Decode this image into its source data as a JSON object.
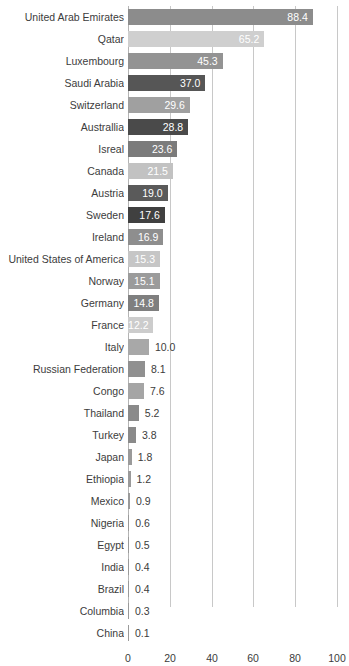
{
  "chart_data": {
    "type": "bar",
    "orientation": "horizontal",
    "title": "",
    "subtitle": "",
    "xlabel": "",
    "ylabel": "",
    "xlim": [
      0,
      100
    ],
    "x_ticks": [
      "0",
      "20",
      "40",
      "60",
      "80",
      "100"
    ],
    "x_tick_values": [
      0,
      20,
      40,
      60,
      80,
      100
    ],
    "grid": true,
    "legend": "none",
    "value_label_format": "one-decimal",
    "categories": [
      "United Arab Emirates",
      "Qatar",
      "Luxembourg",
      "Saudi Arabia",
      "Switzerland",
      "Australlia",
      "Isreal",
      "Canada",
      "Austria",
      "Sweden",
      "Ireland",
      "United States of America",
      "Norway",
      "Germany",
      "France",
      "Italy",
      "Russian Federation",
      "Congo",
      "Thailand",
      "Turkey",
      "Japan",
      "Ethiopia",
      "Mexico",
      "Nigeria",
      "Egypt",
      "India",
      "Brazil",
      "Columbia",
      "China"
    ],
    "values": [
      88.4,
      65.2,
      45.3,
      37.0,
      29.6,
      28.8,
      23.6,
      21.5,
      19.0,
      17.6,
      16.9,
      15.3,
      15.1,
      14.8,
      12.2,
      10.0,
      8.1,
      7.6,
      5.2,
      3.8,
      1.8,
      1.2,
      0.9,
      0.6,
      0.5,
      0.4,
      0.4,
      0.3,
      0.1
    ],
    "value_labels": [
      "88.4",
      "65.2",
      "45.3",
      "37.0",
      "29.6",
      "28.8",
      "23.6",
      "21.5",
      "19.0",
      "17.6",
      "16.9",
      "15.3",
      "15.1",
      "14.8",
      "12.2",
      "10.0",
      "8.1",
      "7.6",
      "5.2",
      "3.8",
      "1.8",
      "1.2",
      "0.9",
      "0.6",
      "0.5",
      "0.4",
      "0.4",
      "0.3",
      "0.1"
    ],
    "bar_colors": [
      "#8c8c8c",
      "#cfcfcf",
      "#939393",
      "#565656",
      "#a0a0a0",
      "#4a4a4a",
      "#7b7b7b",
      "#c2c2c2",
      "#5a5a5a",
      "#404040",
      "#8e8e8e",
      "#c6c6c6",
      "#9b9b9b",
      "#7f7f7f",
      "#cccccc",
      "#a8a8a8",
      "#909090",
      "#a5a5a5",
      "#8a8a8a",
      "#8a8a8a",
      "#9a9a9a",
      "#9a9a9a",
      "#9a9a9a",
      "#9a9a9a",
      "#9a9a9a",
      "#9a9a9a",
      "#9a9a9a",
      "#9a9a9a",
      "#9a9a9a"
    ],
    "label_placement": [
      "inside",
      "inside",
      "inside",
      "inside",
      "inside",
      "inside",
      "inside",
      "inside",
      "inside",
      "inside",
      "inside",
      "inside",
      "inside",
      "inside",
      "inside",
      "outside",
      "outside",
      "outside",
      "outside",
      "outside",
      "outside",
      "outside",
      "outside",
      "outside",
      "outside",
      "outside",
      "outside",
      "outside",
      "outside"
    ]
  },
  "style": {
    "background": "#ffffff",
    "gridline_color": "#c8c8c8",
    "axis_color": "#b4b4b4",
    "text_color": "#3c3c3c",
    "inside_label_color": "#ffffff"
  }
}
